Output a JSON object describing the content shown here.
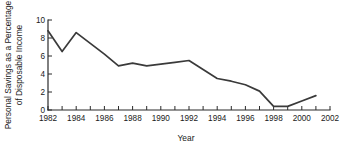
{
  "chart_data": {
    "type": "line",
    "title": "",
    "xlabel": "Year",
    "ylabel": "Personal Savings as a Percentage of Disposable Income",
    "ylabel_line1": "Personal Savings as a Percentage",
    "ylabel_line2": "of Disposable Income",
    "xlim": [
      1982,
      2002
    ],
    "ylim": [
      0,
      10
    ],
    "grid": false,
    "legend": "none",
    "line_color": "#3a3a3a",
    "axis_color": "#2b2b2b",
    "x_tick_values": [
      1982,
      1983,
      1984,
      1985,
      1986,
      1987,
      1988,
      1989,
      1990,
      1991,
      1992,
      1993,
      1994,
      1995,
      1996,
      1997,
      1998,
      1999,
      2000,
      2001,
      2002
    ],
    "x_tick_labels": [
      "1982",
      "",
      "1984",
      "",
      "1986",
      "",
      "1988",
      "",
      "1990",
      "",
      "1992",
      "",
      "1994",
      "",
      "1996",
      "",
      "1998",
      "",
      "2000",
      "",
      "2002"
    ],
    "y_tick_values": [
      0,
      2,
      4,
      6,
      8,
      10
    ],
    "y_tick_labels": [
      "0",
      "2",
      "4",
      "6",
      "8",
      "10"
    ],
    "x": [
      1982,
      1983,
      1984,
      1985,
      1986,
      1987,
      1988,
      1989,
      1990,
      1991,
      1992,
      1993,
      1994,
      1995,
      1996,
      1997,
      1998,
      1999,
      2000,
      2001
    ],
    "values": [
      8.8,
      6.5,
      8.6,
      7.4,
      6.2,
      4.9,
      5.2,
      4.9,
      5.1,
      5.3,
      5.5,
      4.5,
      3.5,
      3.2,
      2.8,
      2.1,
      0.4,
      0.4,
      1.0,
      1.6
    ],
    "series": [
      {
        "name": "Personal savings rate",
        "values": [
          8.8,
          6.5,
          8.6,
          7.4,
          6.2,
          4.9,
          5.2,
          4.9,
          5.1,
          5.3,
          5.5,
          4.5,
          3.5,
          3.2,
          2.8,
          2.1,
          0.4,
          0.4,
          1.0,
          1.6
        ]
      }
    ]
  }
}
